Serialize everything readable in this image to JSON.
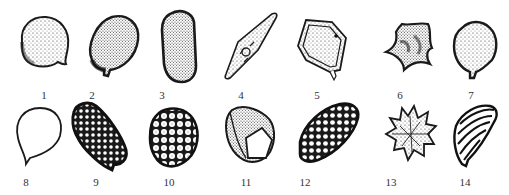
{
  "figure": {
    "ink_color": "#1a1a1a",
    "background": "#ffffff",
    "items": [
      {
        "label": "1",
        "form": "spheroidal-granular-with-tip"
      },
      {
        "label": "2",
        "form": "ovoid-granular-with-tip"
      },
      {
        "label": "3",
        "form": "elongate-granular"
      },
      {
        "label": "4",
        "form": "fusiform-with-central-body"
      },
      {
        "label": "5",
        "form": "polygonal-double-wall"
      },
      {
        "label": "6",
        "form": "stellate-four-lobed"
      },
      {
        "label": "7",
        "form": "rounded-polygonal-granular"
      },
      {
        "label": "8",
        "form": "spheroidal-smooth-outline"
      },
      {
        "label": "9",
        "form": "ellipsoid-reticulate-dots"
      },
      {
        "label": "10",
        "form": "rounded-verrucate"
      },
      {
        "label": "11",
        "form": "ovoid-with-opening"
      },
      {
        "label": "12",
        "form": "ellipsoid-reticulate"
      },
      {
        "label": "13",
        "form": "echinate-spiny"
      },
      {
        "label": "14",
        "form": "ribbed-striate"
      }
    ]
  }
}
